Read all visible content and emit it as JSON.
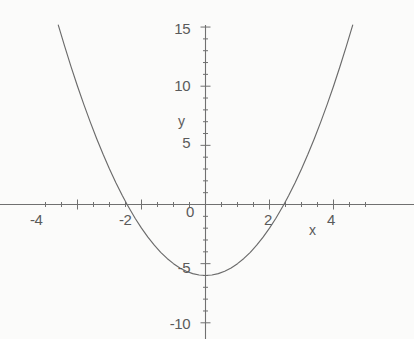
{
  "chart_data": {
    "type": "line",
    "title": "",
    "subtitle": "",
    "xlabel": "x",
    "ylabel": "y",
    "xlim": [
      -5.1,
      5.1
    ],
    "ylim": [
      -10.5,
      15.5
    ],
    "grid": false,
    "legend": null,
    "x_ticks_major": [
      -4,
      -2,
      0,
      2,
      4
    ],
    "x_tick_labels": [
      "-4",
      "-2",
      "0",
      "2",
      "4"
    ],
    "x_minor_tick_step": 0.5,
    "y_ticks_major": [
      15,
      10,
      5,
      -5,
      -10
    ],
    "y_tick_labels": [
      "15",
      "10",
      "5",
      "-5",
      "-10"
    ],
    "y_minor_tick_step": 1,
    "series": [
      {
        "name": "y = x^2 - 6",
        "equation": "y = x^2 - 6",
        "vertex": [
          0,
          -6
        ],
        "roots": [
          -2.45,
          2.45
        ],
        "y_intercept": -6,
        "x": [
          -4.6,
          -4.4,
          -4.2,
          -4.0,
          -3.8,
          -3.6,
          -3.4,
          -3.2,
          -3.0,
          -2.8,
          -2.6,
          -2.45,
          -2.2,
          -2.0,
          -1.8,
          -1.6,
          -1.4,
          -1.2,
          -1.0,
          -0.8,
          -0.6,
          -0.4,
          -0.2,
          0,
          0.2,
          0.4,
          0.6,
          0.8,
          1.0,
          1.2,
          1.4,
          1.6,
          1.8,
          2.0,
          2.2,
          2.45,
          2.6,
          2.8,
          3.0,
          3.2,
          3.4,
          3.6,
          3.8,
          4.0,
          4.2,
          4.4,
          4.6
        ],
        "y": [
          15.16,
          13.36,
          11.64,
          10.0,
          8.44,
          6.96,
          5.56,
          4.24,
          3.0,
          1.84,
          0.76,
          0,
          -1.16,
          -2.0,
          -2.76,
          -3.44,
          -4.04,
          -4.56,
          -5.0,
          -5.36,
          -5.64,
          -5.84,
          -5.96,
          -6.0,
          -5.96,
          -5.84,
          -5.64,
          -5.36,
          -5.0,
          -4.56,
          -4.04,
          -3.44,
          -2.76,
          -2.0,
          -1.16,
          0,
          0.76,
          1.84,
          3.0,
          4.24,
          5.56,
          6.96,
          8.44,
          10.0,
          11.64,
          13.36,
          15.16
        ]
      }
    ],
    "colors": {
      "curve": "#6b6b6b",
      "axis": "#707070",
      "text": "#5a5a5a",
      "background": "#fbfbfa"
    }
  },
  "labels": {
    "x_axis_name": "x",
    "y_axis_name": "y",
    "x_tick_neg4": "-4",
    "x_tick_neg2": "-2",
    "x_tick_zero": "0",
    "x_tick_pos2": "2",
    "x_tick_pos4": "4",
    "y_tick_15": "15",
    "y_tick_10": "10",
    "y_tick_5": "5",
    "y_tick_neg5": "-5",
    "y_tick_neg10": "-10"
  }
}
